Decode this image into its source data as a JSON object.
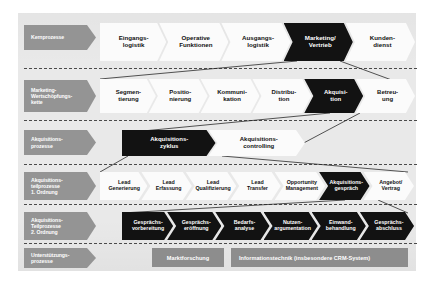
{
  "diagram": {
    "background_color": "#e9e9e9",
    "accent_highlight_color": "#121212",
    "label_chevron_color": "#949494",
    "support_box_color": "#8d8d8d"
  },
  "rows": [
    {
      "id": "kernprozesse",
      "label": "Kernprozesse",
      "items": [
        {
          "text": "Eingangs-\nlogistik",
          "line1": "Eingangs-",
          "line2": "logistik",
          "style": "white"
        },
        {
          "text": "Operative\nFunktionen",
          "line1": "Operative",
          "line2": "Funktionen",
          "style": "white"
        },
        {
          "text": "Ausgangs-\nlogistik",
          "line1": "Ausgangs-",
          "line2": "logistik",
          "style": "white"
        },
        {
          "text": "Marketing/\nVertrieb",
          "line1": "Marketing/",
          "line2": "Vertrieb",
          "style": "black"
        },
        {
          "text": "Kunden-\ndienst",
          "line1": "Kunden-",
          "line2": "dienst",
          "style": "white"
        }
      ]
    },
    {
      "id": "marketing-wertschoepfungskette",
      "label": "Marketing-\nWertschöpfungs-\nkette",
      "items": [
        {
          "line1": "Segmen-",
          "line2": "tierung",
          "style": "white"
        },
        {
          "line1": "Positio-",
          "line2": "nierung",
          "style": "white"
        },
        {
          "line1": "Kommuni-",
          "line2": "kation",
          "style": "white"
        },
        {
          "line1": "Distribu-",
          "line2": "tion",
          "style": "white"
        },
        {
          "line1": "Akquisi-",
          "line2": "tion",
          "style": "black"
        },
        {
          "line1": "Betreu-",
          "line2": "ung",
          "style": "white"
        }
      ]
    },
    {
      "id": "akquisitionsprozesse",
      "label": "Akquisitions-\nprozesse",
      "items": [
        {
          "line1": "Akquisitions-",
          "line2": "zyklus",
          "style": "black"
        },
        {
          "line1": "Akquisitions-",
          "line2": "controlling",
          "style": "white"
        }
      ]
    },
    {
      "id": "akquisitionsteilprozesse-1-ordnung",
      "label": "Akquisitions-\nteilprozesse\n1. Ordnung",
      "items": [
        {
          "line1": "Lead",
          "line2": "Generierung",
          "style": "white"
        },
        {
          "line1": "Lead",
          "line2": "Erfassung",
          "style": "white"
        },
        {
          "line1": "Lead",
          "line2": "Qualifizierung",
          "style": "white"
        },
        {
          "line1": "Lead",
          "line2": "Transfer",
          "style": "white"
        },
        {
          "line1": "Opportunity",
          "line2": "Management",
          "style": "white"
        },
        {
          "line1": "Akquisitions-",
          "line2": "gespräch",
          "style": "black"
        },
        {
          "line1": "Angebot/",
          "line2": "Vertrag",
          "style": "white"
        }
      ]
    },
    {
      "id": "akquisitionsteilprozesse-2-ordnung",
      "label": "Akquisitions-\nTeilprozesse\n2. Ordnung",
      "items": [
        {
          "line1": "Gesprächs-",
          "line2": "vorbereitung",
          "style": "black"
        },
        {
          "line1": "Gesprächs-",
          "line2": "eröffnung",
          "style": "black"
        },
        {
          "line1": "Bedarfs-",
          "line2": "analyse",
          "style": "black"
        },
        {
          "line1": "Nutzen-",
          "line2": "argumentation",
          "style": "black"
        },
        {
          "line1": "Einwand-",
          "line2": "behandlung",
          "style": "black"
        },
        {
          "line1": "Gesprächs-",
          "line2": "abschluss",
          "style": "black"
        }
      ]
    },
    {
      "id": "unterstuetzungsprozesse",
      "label": "Unterstützungs-\nprozesse",
      "items": [
        {
          "line1": "Marktforschung",
          "line2": "",
          "style": "gray"
        },
        {
          "line1": "Informationstechnik (insbesondere CRM-System)",
          "line2": "",
          "style": "gray"
        }
      ]
    }
  ]
}
